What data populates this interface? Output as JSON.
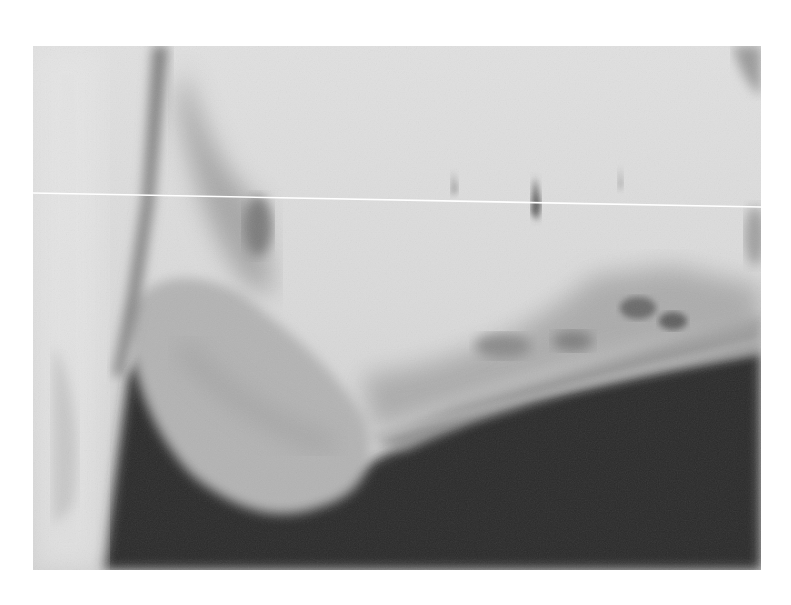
{
  "image": {
    "kind": "radiograph",
    "subject": "lateral view of mandible",
    "colors": {
      "page_background": "#ffffff",
      "soft_tissue_light": "#e2e2e2",
      "bone_mid": "#a9a9a9",
      "background_dark": "#2a2a2a",
      "artifact_line": "#ffffff"
    },
    "frame": {
      "x": 33,
      "y": 46,
      "width": 728,
      "height": 524
    }
  }
}
